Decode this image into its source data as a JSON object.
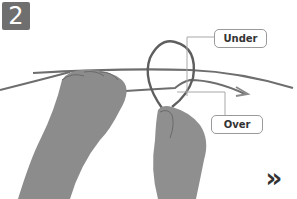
{
  "step": {
    "number": "2"
  },
  "callouts": {
    "under": {
      "label": "Under"
    },
    "over": {
      "label": "Over"
    }
  },
  "navigation": {
    "next_glyph": "»"
  },
  "colors": {
    "badge_bg": "#6f6f6f",
    "badge_text": "#ffffff",
    "rope": "#6a6a6a",
    "callout_border": "#9a9a9a",
    "callout_text": "#333333",
    "skin": "#8a8a8a"
  },
  "icons": {
    "next": "double-chevron-right-icon",
    "arrow": "direction-arrow-icon"
  }
}
